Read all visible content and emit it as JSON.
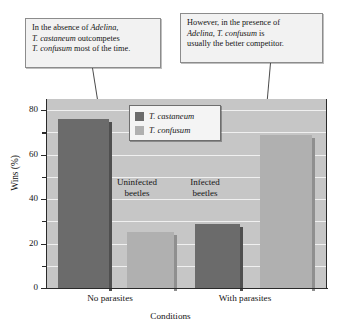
{
  "callouts": [
    {
      "id": "left",
      "lines": [
        [
          {
            "t": "In the absence of ",
            "i": false
          },
          {
            "t": "Adelina,",
            "i": true
          }
        ],
        [
          {
            "t": "T. castaneum",
            "i": true
          },
          {
            "t": " outcompetes",
            "i": false
          }
        ],
        [
          {
            "t": "T. confusum",
            "i": true
          },
          {
            "t": " most of the time.",
            "i": false
          }
        ]
      ],
      "text": "In the absence of Adelina, T. castaneum outcompetes T. confusum most of the time."
    },
    {
      "id": "right",
      "lines": [
        [
          {
            "t": "However, in the presence of",
            "i": false
          }
        ],
        [
          {
            "t": "Adelina, T. confusum",
            "i": true
          },
          {
            "t": " is",
            "i": false
          }
        ],
        [
          {
            "t": "usually the better competitor.",
            "i": false
          }
        ]
      ],
      "text": "However, in the presence of Adelina, T. confusum is usually the better competitor."
    }
  ],
  "annotations": {
    "uninfected": "Uninfected\nbeetles",
    "uninfected_line1": "Uninfected",
    "uninfected_line2": "beetles",
    "infected_line1": "Infected",
    "infected_line2": "beetles"
  },
  "colors": {
    "castaneum": "#6b6b6b",
    "confusum": "#b0b0b0",
    "plot_background": "#c6c6c6",
    "gridline": "#f0f0f0",
    "axis": "#2a2a2a"
  },
  "chart_data": {
    "type": "bar",
    "title": "",
    "xlabel": "Conditions",
    "ylabel": "Wins (%)",
    "categories": [
      "No parasites",
      "With parasites"
    ],
    "series": [
      {
        "name": "T. castaneum",
        "values": [
          76,
          29
        ],
        "color": "#6b6b6b"
      },
      {
        "name": "T. confusum",
        "values": [
          25,
          69
        ],
        "color": "#b0b0b0"
      }
    ],
    "ylim": [
      0,
      85
    ],
    "yticks": [
      0,
      20,
      40,
      60,
      80
    ],
    "ytick_labels": [
      "0",
      "20",
      "40",
      "60",
      "80"
    ],
    "yminor_ticks": [
      10,
      30,
      50,
      70
    ],
    "grid": true,
    "legend_position": "top-center",
    "legend_entries": [
      "T. castaneum",
      "T. confusum"
    ],
    "annotations": [
      "Uninfected beetles",
      "Infected beetles"
    ]
  }
}
